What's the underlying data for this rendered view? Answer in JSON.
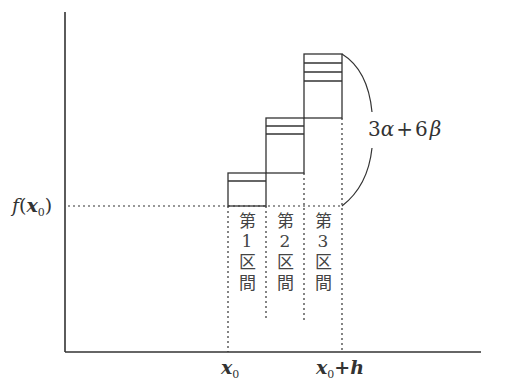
{
  "diagram": {
    "y_axis_label": "f(x₀)",
    "y_label_parts": {
      "func": "f",
      "open": "(",
      "var": "x",
      "sub": "0",
      "close": ")"
    },
    "x_ticks": [
      {
        "var": "x",
        "sub": "0",
        "suffix": ""
      },
      {
        "var": "x",
        "sub": "0",
        "suffix": "+h"
      }
    ],
    "x_tick_labels": [
      "x₀",
      "x₀+h"
    ],
    "brace_label": "3α+6β",
    "brace_label_parts": {
      "c1": "3",
      "g1": "α",
      "op": "+",
      "c2": "6",
      "g2": "β"
    },
    "intervals": [
      {
        "chars": [
          "第",
          "1",
          "区",
          "間"
        ],
        "label": "第1区間",
        "stacked_lines": 1
      },
      {
        "chars": [
          "第",
          "2",
          "区",
          "間"
        ],
        "label": "第2区間",
        "stacked_lines": 2
      },
      {
        "chars": [
          "第",
          "3",
          "区",
          "間"
        ],
        "label": "第3区間",
        "stacked_lines": 3
      }
    ],
    "colors": {
      "line": "#333333",
      "background": "#ffffff"
    }
  }
}
